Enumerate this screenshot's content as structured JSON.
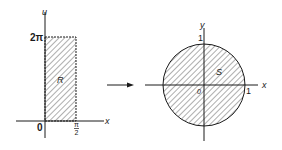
{
  "left_panel": {
    "vertical_axis_label": "u",
    "horizontal_axis_label": "x",
    "origin_label": "0",
    "top_tick_label": "2π",
    "right_tick_label": "π/2",
    "right_tick_num": "π",
    "right_tick_den": "2",
    "region_label": "R"
  },
  "arrow": {
    "direction": "right"
  },
  "right_panel": {
    "vertical_axis_label": "y",
    "horizontal_axis_label": "x",
    "origin_label": "0",
    "top_tick_label": "1",
    "right_tick_label": "1",
    "region_label": "S"
  },
  "colors": {
    "ink": "#1a1a1a",
    "background": "#ffffff"
  }
}
